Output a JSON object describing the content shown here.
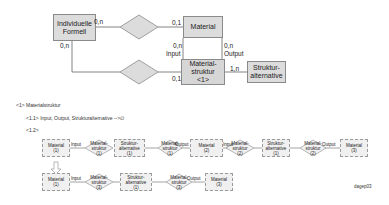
{
  "er_diagram": {
    "entities": {
      "individuelle_formel": "Individuelle Formell",
      "material": "Material",
      "materialstruktur": [
        "Material-",
        "struktur",
        "<1>"
      ],
      "strukturalternative": [
        "Struktur-",
        "alternative"
      ]
    },
    "cardinalities": {
      "formel_top": "0,n",
      "formel_left": "0,n",
      "material_top": "0,1",
      "struktur_left": "0,1",
      "material_input_card": "0,n",
      "material_input": "Input",
      "material_output_card": "0,n",
      "material_output": "Output",
      "struktur_alt": "1,n"
    }
  },
  "notes": {
    "line1": "<1> Materialstruktur",
    "line2": "<1.1> Input, Output, Strukturalternative -->∅",
    "line3": "<1.2>"
  },
  "instance_row1": {
    "nodes": [
      {
        "type": "box",
        "label": "Material",
        "id": "(1)"
      },
      {
        "type": "edge",
        "label": "Input"
      },
      {
        "type": "diamond",
        "label": "Material-\nstruktur",
        "id": "(1)"
      },
      {
        "type": "box",
        "label": "Struktur-\nalternative",
        "id": "(1)"
      },
      {
        "type": "diamond",
        "label": "Material-\nstruktur",
        "id": "(1)"
      },
      {
        "type": "edge",
        "label": "Output"
      },
      {
        "type": "box",
        "label": "Material",
        "id": "(2)"
      },
      {
        "type": "edge",
        "label": "Input"
      },
      {
        "type": "diamond",
        "label": "Material-\nstruktur",
        "id": "(2)"
      },
      {
        "type": "box",
        "label": "Struktur-\nalternative",
        "id": "(1)"
      },
      {
        "type": "diamond",
        "label": "Material-\nstruktur",
        "id": "(2)"
      },
      {
        "type": "edge",
        "label": "Output"
      },
      {
        "type": "box",
        "label": "Material",
        "id": "(3)"
      }
    ],
    "labels": {
      "m1": "Material",
      "m1id": "(1)",
      "in1": "Input",
      "ms1a": "Material-",
      "ms1b": "struktur",
      "ms1c": "(1)",
      "sa1a": "Struktur-",
      "sa1b": "alternative",
      "sa1c": "(1)",
      "ms2a": "Material-",
      "ms2b": "struktur",
      "ms2c": "(1)",
      "out1": "Output",
      "m2": "Material",
      "m2id": "(2)",
      "in2": "Input",
      "ms3a": "Material-",
      "ms3b": "struktur",
      "ms3c": "(2)",
      "sa2a": "Struktur-",
      "sa2b": "alternative",
      "sa2c": "(1)",
      "ms4a": "Material-",
      "ms4b": "struktur",
      "ms4c": "(2)",
      "out2": "Output",
      "m3": "Material",
      "m3id": "(3)"
    }
  },
  "instance_row2": {
    "labels": {
      "m1": "Material",
      "m1id": "(1)",
      "in1": "Input",
      "ms1a": "Material-",
      "ms1b": "struktur",
      "ms1c": "(3)",
      "sa1a": "Struktur-",
      "sa1b": "alternative",
      "sa1c": "(1)",
      "ms2a": "Material-",
      "ms2b": "struktur",
      "ms2c": "(3)",
      "out1": "Output",
      "m3": "Material",
      "m3id": "(3)"
    }
  },
  "figure_id": "dagep03"
}
